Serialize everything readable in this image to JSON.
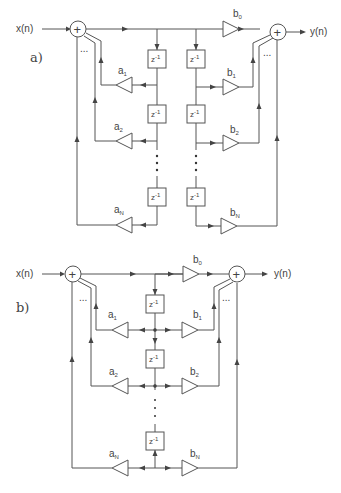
{
  "figure": {
    "panel_a": {
      "tag": "a)",
      "input_label": "x(n)",
      "output_label": "y(n)",
      "delay_label": "z",
      "delay_exp": "-1",
      "feedback_coeffs": [
        {
          "sym": "a",
          "sub": "1"
        },
        {
          "sym": "a",
          "sub": "2"
        },
        {
          "sym": "a",
          "sub": "N"
        }
      ],
      "feedforward_coeffs": [
        {
          "sym": "b",
          "sub": "0"
        },
        {
          "sym": "b",
          "sub": "1"
        },
        {
          "sym": "b",
          "sub": "2"
        },
        {
          "sym": "b",
          "sub": "N"
        }
      ],
      "summer_symbol": "+",
      "ellipsis": "..."
    },
    "panel_b": {
      "tag": "b)",
      "input_label": "x(n)",
      "output_label": "y(n)",
      "delay_label": "z",
      "delay_exp": "-1",
      "feedback_coeffs": [
        {
          "sym": "a",
          "sub": "1"
        },
        {
          "sym": "a",
          "sub": "2"
        },
        {
          "sym": "a",
          "sub": "N"
        }
      ],
      "feedforward_coeffs": [
        {
          "sym": "b",
          "sub": "0"
        },
        {
          "sym": "b",
          "sub": "1"
        },
        {
          "sym": "b",
          "sub": "2"
        },
        {
          "sym": "b",
          "sub": "N"
        }
      ],
      "summer_symbol": "+",
      "ellipsis": "..."
    }
  }
}
